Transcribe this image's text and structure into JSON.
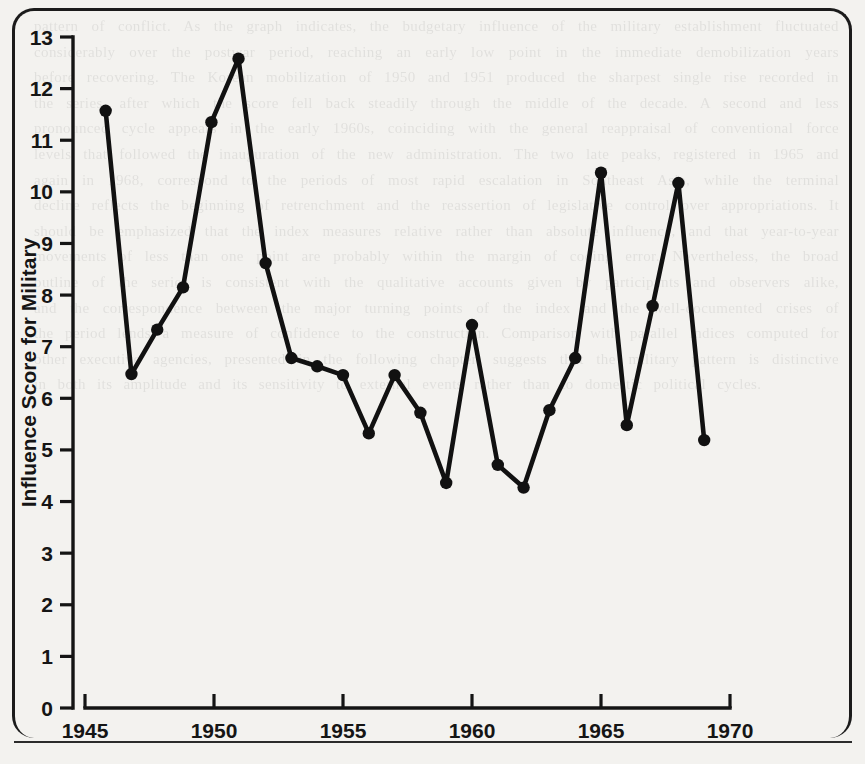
{
  "page": {
    "background_color": "#f3f2ef",
    "ink_color": "#111111",
    "ghost_text": "pattern of conflict. As the graph indicates, the budgetary influence of the military establishment fluctuated considerably over the postwar period, reaching an early low point in the immediate demobilization years before recovering. The Korean mobilization of 1950 and 1951 produced the sharpest single rise recorded in the series, after which the score fell back steadily through the middle of the decade. A second and less pronounced cycle appears in the early 1960s, coinciding with the general reappraisal of conventional force levels that followed the inauguration of the new administration. The two late peaks, registered in 1965 and again in 1968, correspond to the periods of most rapid escalation in Southeast Asia, while the terminal decline reflects the beginning of retrenchment and the reassertion of legislative control over appropriations. It should be emphasized that the index measures relative rather than absolute influence, and that year-to-year movements of less than one point are probably within the margin of coding error. Nevertheless, the broad outline of the series is consistent with the qualitative accounts given by participants and observers alike, and the correspondence between the major turning points of the index and the well-documented crises of the period lends a measure of confidence to the construction. Comparison with parallel indices computed for other executive agencies, presented in the following chapter, suggests that the military pattern is distinctive in both its amplitude and its sensitivity to external events rather than to domestic political cycles."
  },
  "chart_data": {
    "type": "line",
    "title": "",
    "subtitle": "",
    "xlabel": "",
    "ylabel": "Influence Score for Military",
    "xlim": [
      1944.3,
      1970.5
    ],
    "ylim": [
      0,
      13
    ],
    "grid": false,
    "legend": null,
    "x_ticks": [
      1945,
      1950,
      1955,
      1960,
      1965,
      1970
    ],
    "x_tick_labels": [
      "1945",
      "1950",
      "1955",
      "1960",
      "1965",
      "1970"
    ],
    "y_ticks": [
      0,
      1,
      2,
      3,
      4,
      5,
      6,
      7,
      8,
      9,
      10,
      11,
      12,
      13
    ],
    "y_tick_labels": [
      "0",
      "1",
      "2",
      "3",
      "4",
      "5",
      "6",
      "7",
      "8",
      "9",
      "10",
      "11",
      "12",
      "13"
    ],
    "marker": "filled-circle",
    "x": [
      1945.8,
      1946.8,
      1947.8,
      1948.8,
      1949.9,
      1950.95,
      1952.0,
      1953.0,
      1954.0,
      1955.0,
      1956.0,
      1957.0,
      1958.0,
      1959.0,
      1960.0,
      1961.0,
      1962.0,
      1963.0,
      1964.0,
      1965.0,
      1966.0,
      1967.0,
      1968.0,
      1969.0
    ],
    "values": [
      11.57,
      6.47,
      7.33,
      8.15,
      11.35,
      12.58,
      8.62,
      6.78,
      6.62,
      6.45,
      5.32,
      6.45,
      5.72,
      4.36,
      7.42,
      4.71,
      4.27,
      5.77,
      6.78,
      10.37,
      5.48,
      7.79,
      10.17,
      5.19
    ],
    "points": [
      {
        "year": 1945.8,
        "value": 11.57
      },
      {
        "year": 1946.8,
        "value": 6.47
      },
      {
        "year": 1947.8,
        "value": 7.33
      },
      {
        "year": 1948.8,
        "value": 8.15
      },
      {
        "year": 1949.9,
        "value": 11.35
      },
      {
        "year": 1950.95,
        "value": 12.58
      },
      {
        "year": 1952.0,
        "value": 8.62
      },
      {
        "year": 1953.0,
        "value": 6.78
      },
      {
        "year": 1954.0,
        "value": 6.62
      },
      {
        "year": 1955.0,
        "value": 6.45
      },
      {
        "year": 1956.0,
        "value": 5.32
      },
      {
        "year": 1957.0,
        "value": 6.45
      },
      {
        "year": 1958.0,
        "value": 5.72
      },
      {
        "year": 1959.0,
        "value": 4.36
      },
      {
        "year": 1960.0,
        "value": 7.42
      },
      {
        "year": 1961.0,
        "value": 4.71
      },
      {
        "year": 1962.0,
        "value": 4.27
      },
      {
        "year": 1963.0,
        "value": 5.77
      },
      {
        "year": 1964.0,
        "value": 6.78
      },
      {
        "year": 1965.0,
        "value": 10.37
      },
      {
        "year": 1966.0,
        "value": 5.48
      },
      {
        "year": 1967.0,
        "value": 7.79
      },
      {
        "year": 1968.0,
        "value": 10.17
      },
      {
        "year": 1969.0,
        "value": 5.19
      }
    ]
  }
}
